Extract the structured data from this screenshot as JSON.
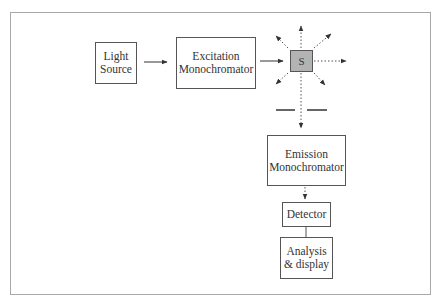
{
  "diagram": {
    "title": "",
    "nodes": {
      "light_source": {
        "line1": "Light",
        "line2": "Source"
      },
      "excitation": {
        "line1": "Excitation",
        "line2": "Monochromator"
      },
      "sample": {
        "label": "S",
        "fill": "#b3b3b3"
      },
      "emission": {
        "line1": "Emission",
        "line2": "Monochromator"
      },
      "detector": {
        "label": "Detector"
      },
      "analysis": {
        "line1": "Analysis",
        "line2": "& display"
      }
    },
    "edges": [
      {
        "from": "Light Source",
        "to": "Excitation Monochromator",
        "style": "solid-arrow"
      },
      {
        "from": "Excitation Monochromator",
        "to": "S",
        "style": "solid-arrow"
      },
      {
        "from": "S",
        "to": "scattered emission (8 directions)",
        "style": "dotted-arrow"
      },
      {
        "from": "S",
        "to": "Emission Monochromator (through slit)",
        "style": "dotted-arrow"
      },
      {
        "from": "Emission Monochromator",
        "to": "Detector",
        "style": "dotted-arrow"
      },
      {
        "from": "Detector",
        "to": "Analysis & display",
        "style": "solid-line"
      }
    ],
    "colors": {
      "frame": "#a8a8a8",
      "line": "#444444",
      "sample_fill": "#b3b3b3"
    }
  }
}
